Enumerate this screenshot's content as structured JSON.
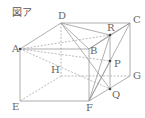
{
  "title": "図ア",
  "diagram": {
    "type": "cube",
    "line_color": "#9a9a9a",
    "hidden_line_color": "#aaaaaa",
    "point_color": "#444444",
    "vertices": {
      "A": {
        "label": "A",
        "x": 20,
        "y": 49
      },
      "B": {
        "label": "B",
        "x": 89,
        "y": 49
      },
      "C": {
        "label": "C",
        "x": 130,
        "y": 23
      },
      "D": {
        "label": "D",
        "x": 61,
        "y": 23
      },
      "E": {
        "label": "E",
        "x": 20,
        "y": 101
      },
      "F": {
        "label": "F",
        "x": 89,
        "y": 101
      },
      "G": {
        "label": "G",
        "x": 130,
        "y": 76
      },
      "H": {
        "label": "H",
        "x": 61,
        "y": 76
      },
      "R": {
        "label": "R",
        "x": 110,
        "y": 35
      },
      "P": {
        "label": "P",
        "x": 110,
        "y": 61
      },
      "Q": {
        "label": "Q",
        "x": 110,
        "y": 89
      }
    },
    "solid_edges": [
      [
        "A",
        "B"
      ],
      [
        "B",
        "C"
      ],
      [
        "C",
        "D"
      ],
      [
        "D",
        "A"
      ],
      [
        "A",
        "E"
      ],
      [
        "E",
        "F"
      ],
      [
        "B",
        "F"
      ],
      [
        "C",
        "G"
      ],
      [
        "F",
        "G"
      ],
      [
        "R",
        "Q"
      ],
      [
        "D",
        "R"
      ],
      [
        "R",
        "C"
      ],
      [
        "C",
        "F"
      ],
      [
        "D",
        "B"
      ],
      [
        "D",
        "Q"
      ],
      [
        "B",
        "R"
      ],
      [
        "F",
        "P"
      ],
      [
        "F",
        "R"
      ]
    ],
    "hidden_edges": [
      [
        "D",
        "H"
      ],
      [
        "H",
        "E"
      ],
      [
        "H",
        "G"
      ],
      [
        "A",
        "R"
      ],
      [
        "A",
        "P"
      ],
      [
        "A",
        "Q"
      ]
    ]
  }
}
